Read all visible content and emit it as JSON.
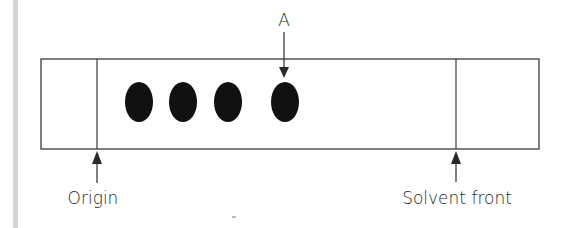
{
  "diagram": {
    "type": "chromatography-plate",
    "labels": {
      "spot_marker": "A",
      "origin": "Origin",
      "solvent_front": "Solvent front"
    },
    "spots": [
      {
        "id": "spot-1"
      },
      {
        "id": "spot-2"
      },
      {
        "id": "spot-3"
      },
      {
        "id": "spot-A",
        "label": "A"
      }
    ],
    "colors": {
      "line": "#3a3a3a",
      "spot": "#111111",
      "text": "#2a2a2a",
      "side_bar": "#d4d4d4"
    }
  }
}
